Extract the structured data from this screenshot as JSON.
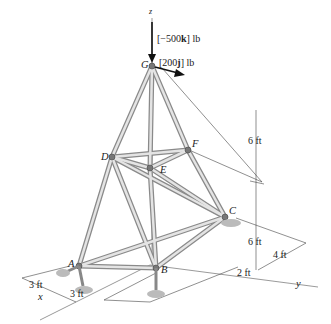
{
  "diagram": {
    "type": "space-truss",
    "nodes": [
      {
        "id": "G",
        "label": "G",
        "x": 152,
        "y": 66
      },
      {
        "id": "D",
        "label": "D",
        "x": 112,
        "y": 157
      },
      {
        "id": "F",
        "label": "F",
        "x": 188,
        "y": 150
      },
      {
        "id": "E",
        "label": "E",
        "x": 150,
        "y": 168
      },
      {
        "id": "C",
        "label": "C",
        "x": 225,
        "y": 217
      },
      {
        "id": "A",
        "label": "A",
        "x": 79,
        "y": 266
      },
      {
        "id": "B",
        "label": "B",
        "x": 156,
        "y": 268
      }
    ],
    "members": [
      [
        "G",
        "D"
      ],
      [
        "G",
        "F"
      ],
      [
        "G",
        "E"
      ],
      [
        "D",
        "F"
      ],
      [
        "D",
        "E"
      ],
      [
        "E",
        "F"
      ],
      [
        "D",
        "A"
      ],
      [
        "D",
        "B"
      ],
      [
        "D",
        "C"
      ],
      [
        "E",
        "B"
      ],
      [
        "E",
        "C"
      ],
      [
        "F",
        "C"
      ],
      [
        "A",
        "B"
      ],
      [
        "A",
        "C"
      ],
      [
        "B",
        "C"
      ]
    ],
    "loads": {
      "vertical": {
        "prefix": "[−500",
        "vector": "k",
        "suffix": "] lb"
      },
      "horizontal": {
        "prefix": "[200",
        "vector": "j",
        "suffix": "] lb"
      }
    },
    "axes": {
      "x": "x",
      "y": "y",
      "z": "z"
    },
    "dimensions": {
      "upper_height": "6 ft",
      "lower_height": "6 ft",
      "depth_y": "4 ft",
      "offset_y": "2 ft",
      "x_left": "3 ft",
      "x_right": "3 ft"
    }
  }
}
